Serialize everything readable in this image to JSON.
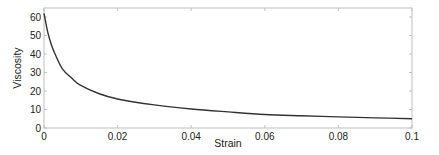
{
  "chart_data": {
    "type": "line",
    "title": "",
    "xlabel": "Strain",
    "ylabel": "Viscosity",
    "xlim": [
      0,
      0.1
    ],
    "ylim": [
      0,
      65
    ],
    "grid": false,
    "legend": null,
    "x_ticks": [
      0,
      0.02,
      0.04,
      0.06,
      0.08,
      0.1
    ],
    "x_tick_labels": [
      "0",
      "0.02",
      "0.04",
      "0.06",
      "0.08",
      "0.1"
    ],
    "y_ticks": [
      0,
      10,
      20,
      30,
      40,
      50,
      60
    ],
    "y_tick_labels": [
      "0",
      "10",
      "20",
      "30",
      "40",
      "50",
      "60"
    ],
    "series": [
      {
        "name": "Viscosity",
        "color": "#333333",
        "x": [
          0,
          0.001,
          0.002,
          0.003,
          0.005,
          0.0075,
          0.01,
          0.015,
          0.02,
          0.03,
          0.04,
          0.05,
          0.06,
          0.07,
          0.08,
          0.09,
          0.1
        ],
        "y": [
          62,
          52,
          45,
          40,
          32,
          27,
          23,
          18.5,
          15.7,
          12.5,
          10.3,
          8.7,
          7.3,
          6.6,
          6.0,
          5.5,
          5.0
        ]
      }
    ]
  },
  "colors": {
    "line": "#333333",
    "axes": "#bfbfbf",
    "text": "#222222"
  }
}
